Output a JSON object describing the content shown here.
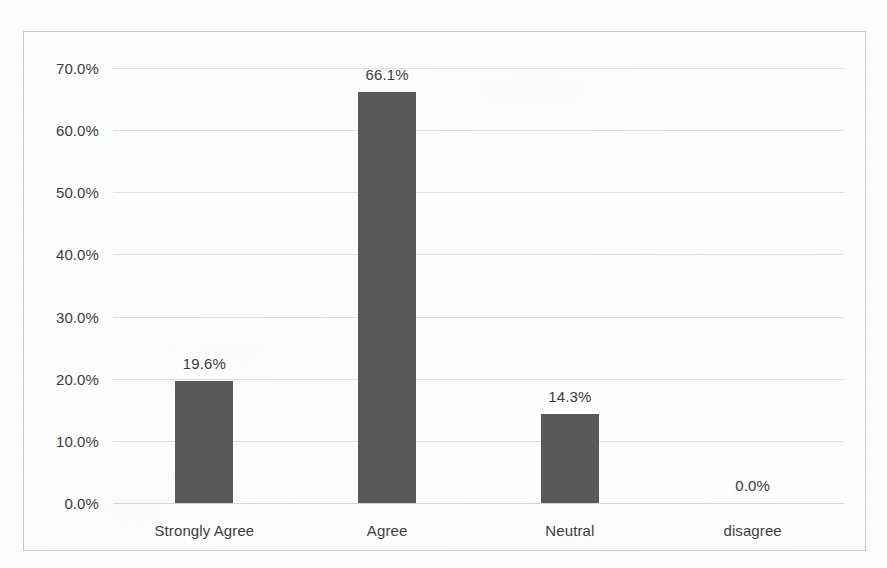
{
  "chart_data": {
    "type": "bar",
    "title": "",
    "subtitle": "",
    "xlabel": "",
    "ylabel": "",
    "categories": [
      "Strongly Agree",
      "Agree",
      "Neutral",
      "disagree"
    ],
    "values": [
      19.6,
      66.1,
      14.3,
      0.0
    ],
    "data_labels": [
      "19.6%",
      "66.1%",
      "14.3%",
      "0.0%"
    ],
    "ylim": [
      0,
      70
    ],
    "ytick_values": [
      0,
      10,
      20,
      30,
      40,
      50,
      60,
      70
    ],
    "ytick_labels": [
      "0.0%",
      "10.0%",
      "20.0%",
      "30.0%",
      "40.0%",
      "50.0%",
      "60.0%",
      "70.0%"
    ],
    "value_format": "percent_one_decimal",
    "grid": "horizontal",
    "legend": "none",
    "series": [
      {
        "name": "Response share",
        "values": [
          19.6,
          66.1,
          14.3,
          0.0
        ]
      }
    ]
  },
  "style": {
    "bar_color": "#595959",
    "gridline_color": "#dedede",
    "frame_border_color": "#c9c9c9",
    "text_color": "#3c3c3c",
    "background_color": "#fefefe"
  }
}
